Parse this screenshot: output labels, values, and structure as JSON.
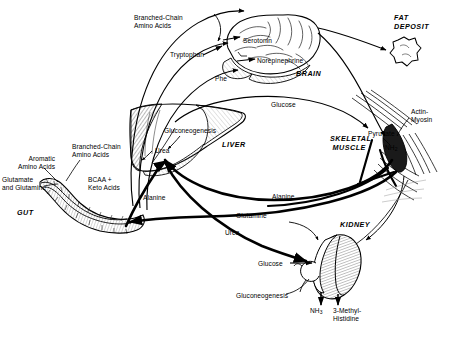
{
  "figure": {
    "domain": "biochemistry-pathway-diagram",
    "background_color": "#ffffff",
    "line_color": "#000000",
    "width": 451,
    "height": 337
  },
  "organs": [
    {
      "id": "brain",
      "label": "BRAIN",
      "x": 296,
      "y": 70
    },
    {
      "id": "fat-deposit",
      "label": "FAT\nDEPOSIT",
      "x": 394,
      "y": 17
    },
    {
      "id": "liver",
      "label": "LIVER",
      "x": 222,
      "y": 143
    },
    {
      "id": "skeletal-muscle",
      "label": "SKELETAL\nMUSCLE",
      "x": 330,
      "y": 138
    },
    {
      "id": "kidney",
      "label": "KIDNEY",
      "x": 340,
      "y": 224
    },
    {
      "id": "gut",
      "label": "GUT",
      "x": 17,
      "y": 211
    }
  ],
  "metabolites": [
    {
      "id": "branched-chain-amino-acids-brain",
      "label": "Branched-Chain\nAmino Acids",
      "x": 134,
      "y": 18,
      "align": "left"
    },
    {
      "id": "tryptophan",
      "label": "Tryptophan",
      "x": 170,
      "y": 52,
      "align": "left"
    },
    {
      "id": "phe",
      "label": "Phe",
      "x": 215,
      "y": 76,
      "align": "left"
    },
    {
      "id": "serotonin",
      "label": "Serotonin",
      "x": 243,
      "y": 38,
      "align": "left"
    },
    {
      "id": "norepinephrine",
      "label": "Norepinephrine",
      "x": 258,
      "y": 58,
      "align": "left"
    },
    {
      "id": "glucose-liver",
      "label": "Glucose",
      "x": 271,
      "y": 102,
      "align": "left"
    },
    {
      "id": "gluconeogenesis-liver",
      "label": "Gluconeogenesis",
      "x": 165,
      "y": 128,
      "align": "left"
    },
    {
      "id": "urea-liver",
      "label": "Urea",
      "x": 155,
      "y": 148,
      "align": "left"
    },
    {
      "id": "aromatic-amino-acids",
      "label": "Aromatic\nAmino Acids",
      "x": 18,
      "y": 157,
      "align": "left"
    },
    {
      "id": "branched-chain-amino-acids-gut",
      "label": "Branched-Chain\nAmino Acids",
      "x": 72,
      "y": 146,
      "align": "left"
    },
    {
      "id": "glutamate-and-glutamine",
      "label": "Glutamate\nand Glutamine",
      "x": 7,
      "y": 178,
      "align": "left"
    },
    {
      "id": "bcaa-plus-keto-acids",
      "label": "BCAA +\nKeto Acids",
      "x": 88,
      "y": 178,
      "align": "left"
    },
    {
      "id": "alanine-liver",
      "label": "Alanine",
      "x": 143,
      "y": 195,
      "align": "left"
    },
    {
      "id": "alanine-muscle",
      "label": "Alanine",
      "x": 272,
      "y": 194,
      "align": "left"
    },
    {
      "id": "glutamine",
      "label": "Glutamine",
      "x": 236,
      "y": 213,
      "align": "left"
    },
    {
      "id": "urea-kidney",
      "label": "Urea",
      "x": 225,
      "y": 230,
      "align": "left"
    },
    {
      "id": "pyruvate",
      "label": "Pyruvate",
      "x": 368,
      "y": 131,
      "align": "left"
    },
    {
      "id": "nh2",
      "label": "NH",
      "sub": "2",
      "x": 385,
      "y": 145,
      "align": "left"
    },
    {
      "id": "actin-myosin",
      "label": "Actin-\nMyosin",
      "x": 411,
      "y": 111,
      "align": "left"
    },
    {
      "id": "glucose-kidney",
      "label": "Glucose",
      "x": 258,
      "y": 262,
      "align": "left"
    },
    {
      "id": "gluconeogenesis-kidney",
      "label": "Gluconeogenesis",
      "x": 238,
      "y": 294,
      "align": "left"
    },
    {
      "id": "nh3",
      "label": "NH",
      "sub": "3",
      "x": 311,
      "y": 309,
      "align": "left"
    },
    {
      "id": "3-methyl-histidine",
      "label": "3-Methyl-\nHistidine",
      "x": 337,
      "y": 309,
      "align": "left"
    }
  ],
  "flux_paths": [
    {
      "from": "gut",
      "to": "brain",
      "label": "Branched-Chain Amino Acids"
    },
    {
      "from": "gut",
      "to": "brain",
      "label": "Tryptophan"
    },
    {
      "from": "gut",
      "to": "brain",
      "label": "Phe"
    },
    {
      "from": "brain",
      "to": "fat-deposit",
      "label": ""
    },
    {
      "from": "liver",
      "to": "skeletal-muscle",
      "label": "Glucose"
    },
    {
      "from": "gut",
      "to": "liver",
      "label": "Alanine"
    },
    {
      "from": "skeletal-muscle",
      "to": "liver",
      "label": "Alanine"
    },
    {
      "from": "skeletal-muscle",
      "to": "gut",
      "label": "Glutamine"
    },
    {
      "from": "liver",
      "to": "kidney",
      "label": "Urea"
    },
    {
      "from": "kidney",
      "to": "output",
      "label": "NH3"
    },
    {
      "from": "skeletal-muscle",
      "to": "output",
      "label": "3-Methyl-Histidine"
    }
  ]
}
